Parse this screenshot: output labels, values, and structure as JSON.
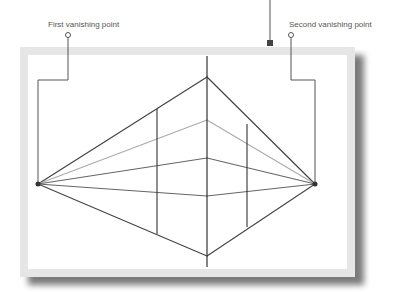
{
  "labels": {
    "first_vanishing_point": "First vanishing point",
    "second_vanishing_point": "Second vanishing point"
  },
  "colors": {
    "frame_border": "#e4e4e4",
    "shadow": "#8a8a8a",
    "line_dark": "#333333",
    "line_mid": "#666666",
    "line_light": "#aaaaaa",
    "callout": "#555555"
  },
  "diagram": {
    "type": "two-point perspective",
    "vanishing_points": [
      {
        "name": "First vanishing point",
        "x": 38,
        "y": 184
      },
      {
        "name": "Second vanishing point",
        "x": 315,
        "y": 184
      }
    ],
    "front_edge": {
      "x": 207,
      "top": 77,
      "bottom": 256
    },
    "side_edges": [
      {
        "x": 157,
        "top": 110,
        "bottom": 233
      },
      {
        "x": 247,
        "top": 125,
        "bottom": 226
      }
    ]
  }
}
